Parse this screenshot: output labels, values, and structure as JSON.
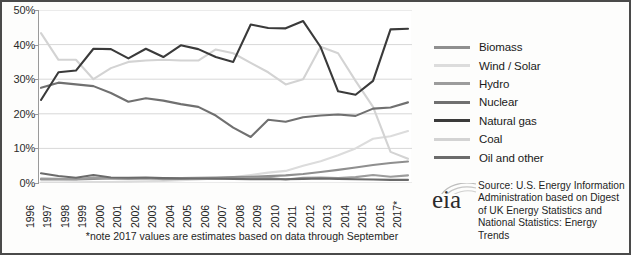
{
  "chart_data": {
    "type": "line",
    "title": "",
    "subtitle": "",
    "xlabel": "",
    "ylabel": "",
    "ylim": [
      0,
      50
    ],
    "ytick_labels": [
      "0%",
      "10%",
      "20%",
      "30%",
      "40%",
      "50%"
    ],
    "ytick_values": [
      0,
      10,
      20,
      30,
      40,
      50
    ],
    "grid": true,
    "legend_position": "right",
    "categories": [
      "1996",
      "1997",
      "1998",
      "1999",
      "2000",
      "2001",
      "2002",
      "2003",
      "2004",
      "2005",
      "2006",
      "2007",
      "2008",
      "2009",
      "2010",
      "2011",
      "2012",
      "2013",
      "2014",
      "2015",
      "2016",
      "2017*"
    ],
    "series": [
      {
        "name": "Biomass",
        "color": "#8f8f8f",
        "values": [
          1.0,
          1.0,
          1.0,
          1.2,
          1.3,
          1.3,
          1.3,
          1.4,
          1.4,
          1.5,
          1.6,
          1.7,
          1.8,
          2.0,
          2.2,
          2.6,
          3.2,
          3.8,
          4.5,
          5.2,
          5.8,
          6.2
        ]
      },
      {
        "name": "Wind / Solar",
        "color": "#dcdcdc",
        "values": [
          0.1,
          0.1,
          0.2,
          0.3,
          0.3,
          0.4,
          0.5,
          0.6,
          0.8,
          1.0,
          1.3,
          1.7,
          2.3,
          3.0,
          3.5,
          5.0,
          6.3,
          8.0,
          10.0,
          12.8,
          13.5,
          15.0
        ]
      },
      {
        "name": "Hydro",
        "color": "#9c9c9c",
        "values": [
          1.3,
          1.2,
          1.1,
          1.6,
          1.3,
          1.2,
          1.4,
          1.1,
          1.2,
          1.3,
          1.2,
          1.3,
          1.4,
          1.5,
          1.0,
          1.5,
          1.6,
          1.4,
          1.7,
          2.3,
          1.8,
          2.2
        ]
      },
      {
        "name": "Nuclear",
        "color": "#707070",
        "values": [
          27.5,
          29.0,
          28.5,
          28.0,
          26.0,
          23.5,
          24.5,
          23.8,
          22.8,
          22.0,
          19.5,
          16.0,
          13.3,
          18.3,
          17.7,
          19.0,
          19.5,
          19.8,
          19.4,
          21.5,
          21.8,
          23.3
        ]
      },
      {
        "name": "Natural gas",
        "color": "#3a3a3a",
        "values": [
          24.0,
          32.0,
          32.5,
          38.8,
          38.7,
          36.0,
          38.8,
          36.4,
          39.8,
          38.7,
          36.4,
          35.0,
          45.8,
          44.8,
          44.7,
          46.8,
          39.3,
          26.5,
          25.5,
          29.5,
          44.4,
          44.6
        ]
      },
      {
        "name": "Coal",
        "color": "#d3d3d3",
        "values": [
          43.3,
          35.6,
          35.6,
          30.0,
          33.2,
          35.0,
          35.4,
          35.6,
          35.4,
          35.4,
          38.6,
          37.5,
          34.7,
          32.0,
          28.5,
          30.0,
          39.4,
          37.5,
          29.5,
          22.0,
          9.0,
          7.0
        ]
      },
      {
        "name": "Oil and other",
        "color": "#6b6b6b",
        "values": [
          2.8,
          2.0,
          1.5,
          2.3,
          1.6,
          1.5,
          1.6,
          1.4,
          1.3,
          1.3,
          1.3,
          1.2,
          1.1,
          1.1,
          1.1,
          1.2,
          1.3,
          1.2,
          1.1,
          1.0,
          0.9,
          0.9
        ]
      }
    ],
    "footnote": "*note 2017 values are estimates based on data through September"
  },
  "legend": {
    "items": [
      {
        "label": "Biomass"
      },
      {
        "label": "Wind / Solar"
      },
      {
        "label": "Hydro"
      },
      {
        "label": "Nuclear"
      },
      {
        "label": "Natural gas"
      },
      {
        "label": "Coal"
      },
      {
        "label": "Oil and other"
      }
    ]
  },
  "footnote": "*note 2017 values are estimates based on data through September",
  "source": {
    "logo_text": "eia",
    "text": "Source: U.S. Energy Information Administration based on Digest of UK Energy Statistics and National Statistics: Energy Trends"
  },
  "colors": {
    "frame": "#4a4a4a",
    "grid": "#d8d8d8",
    "axis": "#9a9a9a",
    "text": "#1f1f1f"
  }
}
